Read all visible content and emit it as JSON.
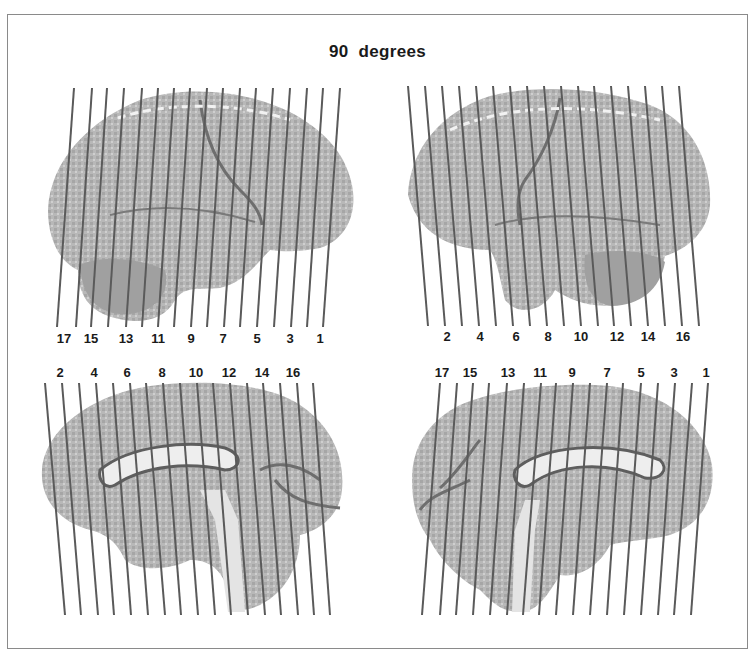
{
  "title": "90  degrees",
  "colors": {
    "line": "#5a5a5a",
    "border": "#8a8a8a",
    "brain_fill": "#b4b4b4",
    "brain_dark": "#6e6e6e",
    "brain_light": "#e6e6e6"
  },
  "panels": [
    {
      "id": "top-left",
      "view": "lateral-left",
      "labels": [
        "17",
        "15",
        "13",
        "11",
        "9",
        "7",
        "5",
        "3",
        "1"
      ],
      "label_x": [
        64,
        91,
        126,
        158,
        191,
        223,
        257,
        290,
        320
      ],
      "label_y": 343,
      "line_top_y": 88,
      "line_bottom_y": 327,
      "line_top_x": [
        74,
        92,
        107,
        124,
        142,
        158,
        174,
        190,
        207,
        223,
        240,
        256,
        273,
        290,
        307,
        323,
        340
      ],
      "line_bottom_x": [
        57,
        76,
        91,
        108,
        126,
        142,
        158,
        174,
        191,
        207,
        224,
        240,
        257,
        274,
        291,
        307,
        323
      ]
    },
    {
      "id": "top-right",
      "view": "lateral-right",
      "labels": [
        "2",
        "4",
        "6",
        "8",
        "10",
        "12",
        "14",
        "16"
      ],
      "label_x": [
        447,
        480,
        516,
        548,
        581,
        617,
        648,
        683
      ],
      "label_y": 341,
      "line_top_y": 86,
      "line_bottom_y": 326,
      "line_top_x": [
        408,
        425,
        442,
        459,
        476,
        493,
        510,
        527,
        544,
        561,
        578,
        594,
        611,
        628,
        645,
        662,
        679
      ],
      "line_bottom_x": [
        428,
        445,
        462,
        479,
        496,
        513,
        530,
        547,
        564,
        581,
        598,
        614,
        631,
        648,
        665,
        682,
        699
      ]
    },
    {
      "id": "bottom-left",
      "view": "medial-left",
      "labels": [
        "2",
        "4",
        "6",
        "8",
        "10",
        "12",
        "14",
        "16"
      ],
      "label_x": [
        60,
        94,
        127,
        162,
        196,
        229,
        262,
        293
      ],
      "label_y": 377,
      "line_top_y": 383,
      "line_bottom_y": 615,
      "line_top_x": [
        45,
        62,
        79,
        96,
        113,
        130,
        146,
        163,
        180,
        197,
        213,
        230,
        247,
        263,
        280,
        297,
        313
      ],
      "line_bottom_x": [
        65,
        81,
        98,
        114,
        131,
        148,
        165,
        181,
        198,
        215,
        231,
        248,
        265,
        281,
        298,
        314,
        330
      ]
    },
    {
      "id": "bottom-right",
      "view": "medial-right",
      "labels": [
        "17",
        "15",
        "13",
        "11",
        "9",
        "7",
        "5",
        "3",
        "1"
      ],
      "label_x": [
        442,
        470,
        508,
        540,
        572,
        607,
        641,
        674,
        706
      ],
      "label_y": 377,
      "line_top_y": 383,
      "line_bottom_y": 615,
      "line_top_x": [
        440,
        457,
        473,
        489,
        507,
        524,
        541,
        556,
        573,
        590,
        607,
        623,
        641,
        658,
        675,
        692,
        708
      ],
      "line_bottom_x": [
        422,
        440,
        456,
        473,
        490,
        507,
        523,
        539,
        556,
        573,
        590,
        607,
        624,
        641,
        658,
        674,
        691
      ]
    }
  ]
}
